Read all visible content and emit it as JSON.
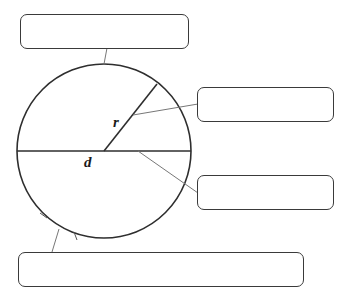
{
  "diagram": {
    "title": "",
    "labels": {
      "radius": "r",
      "diameter": "d"
    },
    "boxes": [
      {
        "id": "top",
        "text": ""
      },
      {
        "id": "right-upper",
        "text": ""
      },
      {
        "id": "right-lower",
        "text": ""
      },
      {
        "id": "bottom",
        "text": ""
      }
    ],
    "colors": {
      "stroke": "#2e2e2e",
      "leader": "#777777",
      "box_border": "#3a3a3a",
      "background": "#ffffff"
    }
  }
}
